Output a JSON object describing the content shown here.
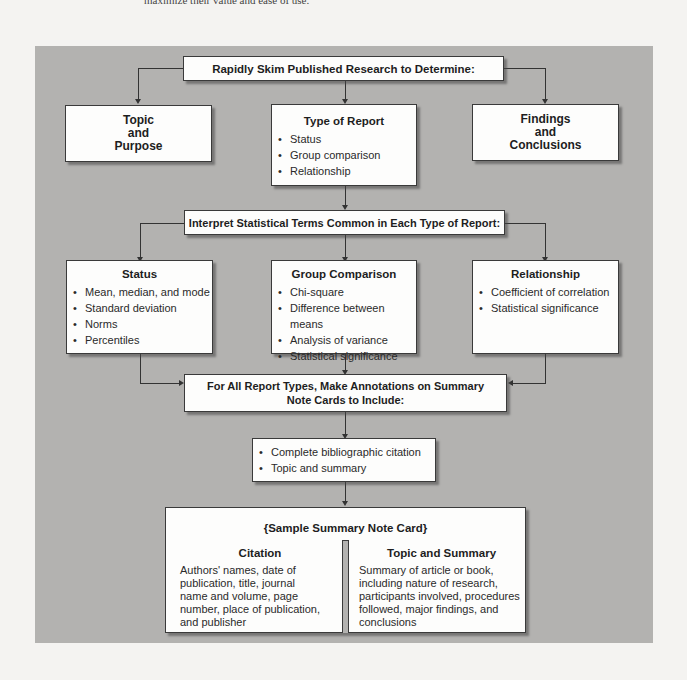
{
  "page": {
    "cut_off_text": "maximize their value and ease of use."
  },
  "step1": {
    "header": "Rapidly Skim Published Research to Determine:",
    "topic": [
      "Topic",
      "and",
      "Purpose"
    ],
    "type_of_report": {
      "title": "Type of Report",
      "items": [
        "Status",
        "Group comparison",
        "Relationship"
      ]
    },
    "findings": [
      "Findings",
      "and",
      "Conclusions"
    ]
  },
  "step2": {
    "header": "Interpret Statistical Terms Common in Each Type of Report:",
    "status": {
      "title": "Status",
      "items": [
        "Mean, median, and mode",
        "Standard deviation",
        "Norms",
        "Percentiles"
      ]
    },
    "group_comparison": {
      "title": "Group Comparison",
      "items": [
        "Chi-square",
        "Difference between means",
        "Analysis of variance",
        "Statistical significance"
      ]
    },
    "relationship": {
      "title": "Relationship",
      "items": [
        "Coefficient of correlation",
        "Statistical significance"
      ]
    }
  },
  "step3": {
    "header_line1": "For All Report Types, Make Annotations on Summary",
    "header_line2": "Note Cards to Include:",
    "items": [
      "Complete bibliographic citation",
      "Topic and summary"
    ]
  },
  "note_card": {
    "title": "{Sample Summary Note Card}",
    "citation": {
      "title": "Citation",
      "lines": [
        "Authors' names, date of",
        "publication, title, journal",
        "name and volume, page",
        "number, place of publication,",
        "and publisher"
      ]
    },
    "topic_summary": {
      "title": "Topic and Summary",
      "lines": [
        "Summary of article or book,",
        "including nature of research,",
        "participants involved, procedures",
        "followed, major findings, and",
        "conclusions"
      ]
    }
  },
  "colors": {
    "panel": "#b3b2b0",
    "box": "#fdfdfc",
    "line": "#333333",
    "page": "#f4f3f1"
  }
}
